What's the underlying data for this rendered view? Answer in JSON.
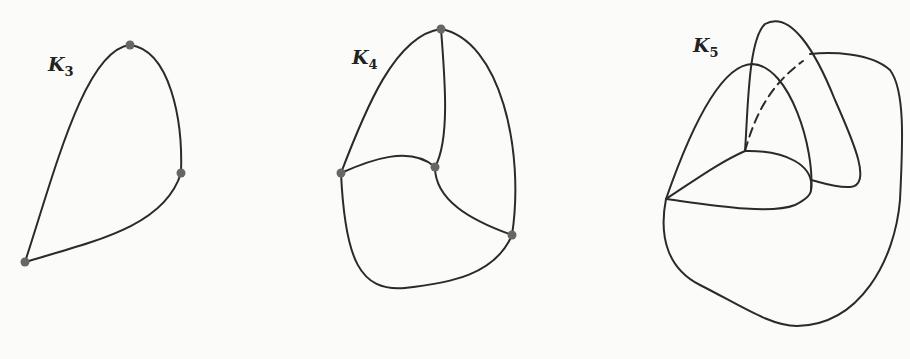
{
  "figure": {
    "panels": [
      {
        "id": "k3",
        "label": "K",
        "subscript": "3",
        "vertices": 3
      },
      {
        "id": "k4",
        "label": "K",
        "subscript": "4",
        "vertices": 4
      },
      {
        "id": "k5",
        "label": "K",
        "subscript": "5",
        "vertices": 5
      }
    ],
    "colors": {
      "stroke": "#2a2a2a",
      "vertex": "#666666",
      "background": "#fbfbfa"
    }
  }
}
